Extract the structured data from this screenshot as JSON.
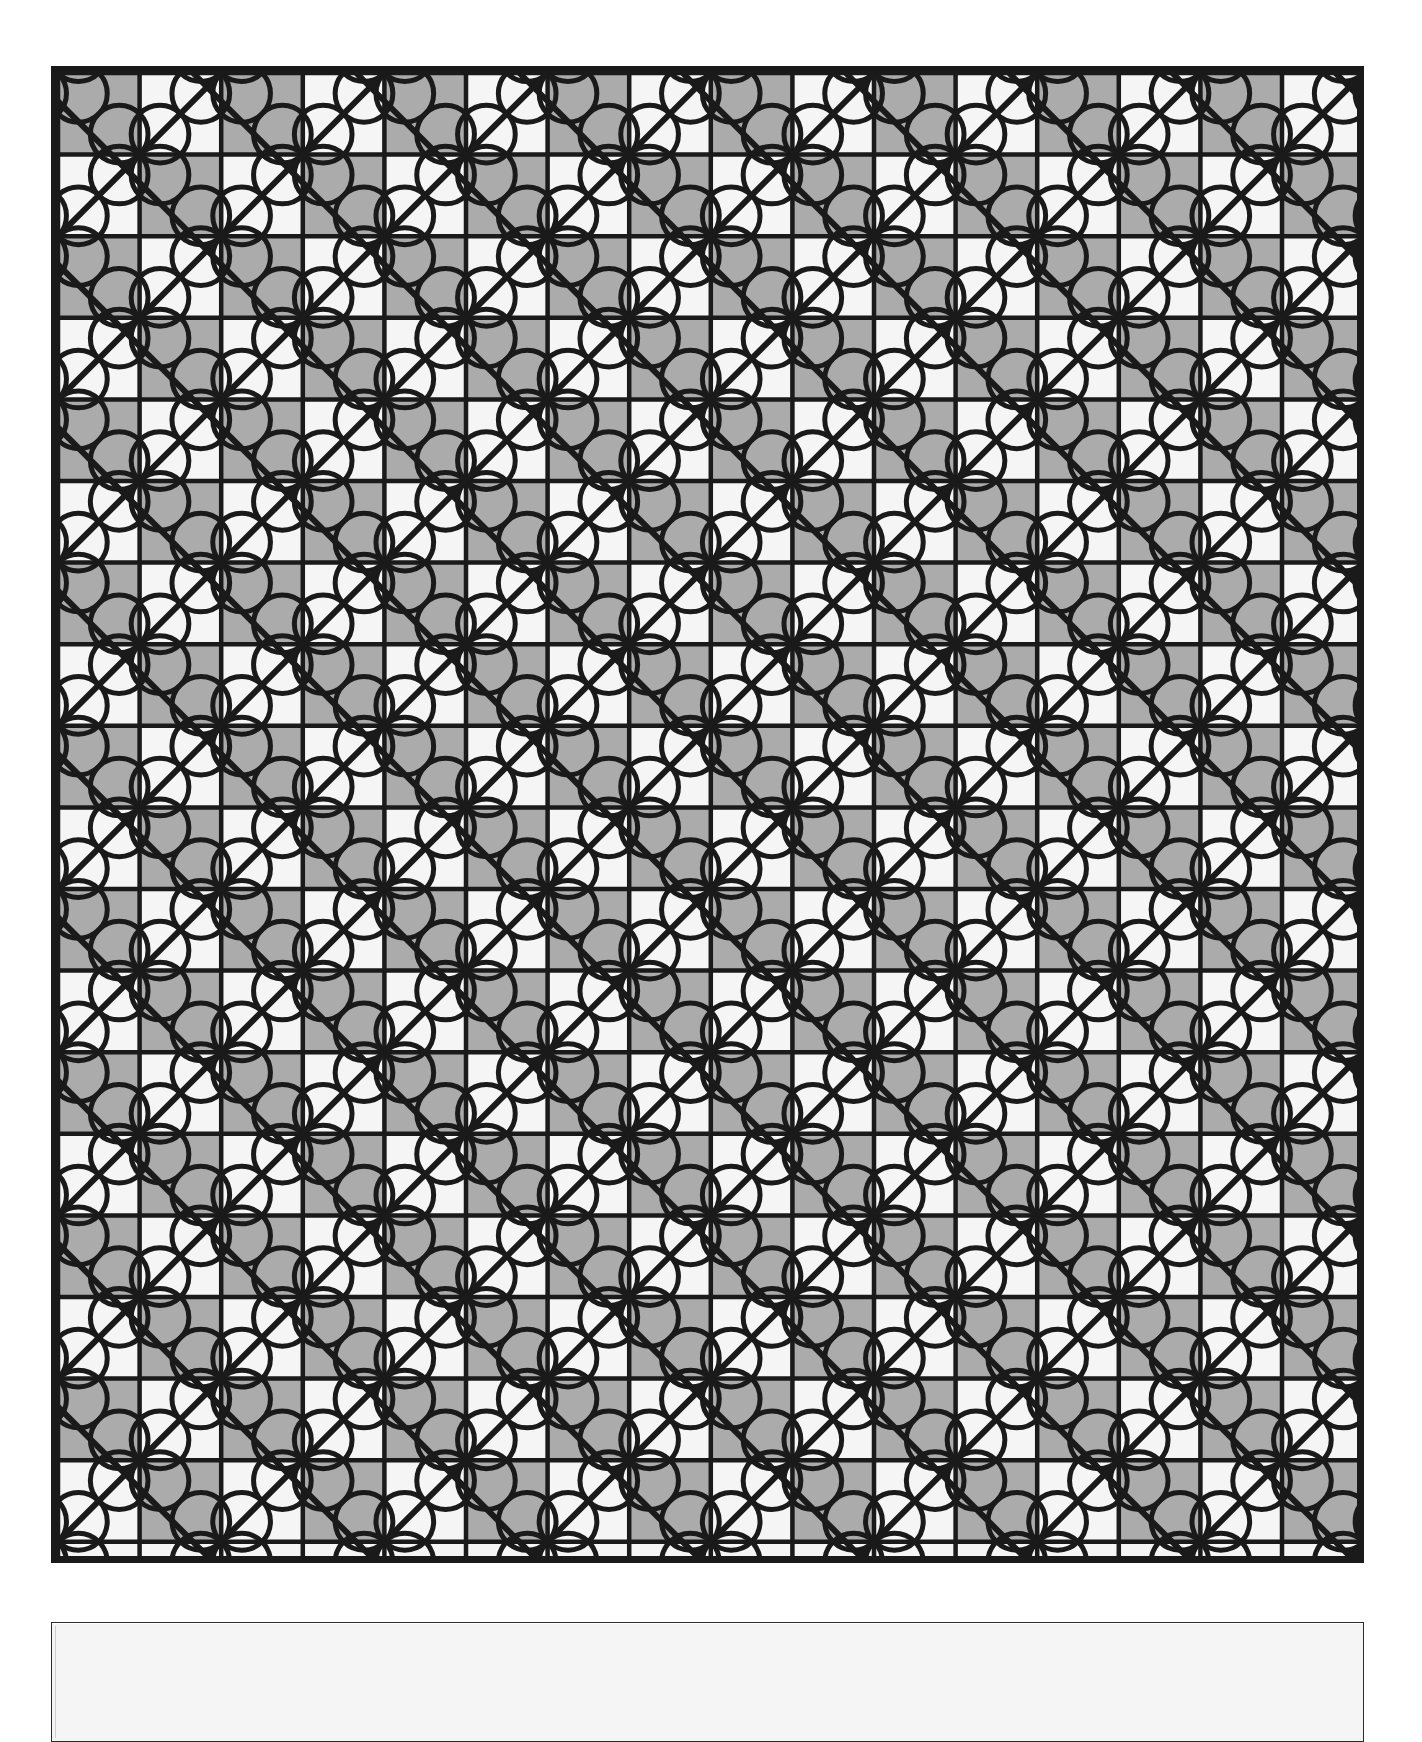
{
  "document": {
    "title": "Quatrefoil Lattice Tiling Pattern",
    "background_color": "#ffffff",
    "width": 1422,
    "height": 1648
  },
  "main_panel": {
    "name": "pattern-figure",
    "description": "Black and white geometric tiling: checkerboard of squares overlaid with outlined quatrefoil flowers at alternating lattice intersections and continuous 45-degree diagonal lines",
    "x": 51,
    "y": 66,
    "width": 1313,
    "height": 1497,
    "border_color": "#1a1a1a",
    "border_width": 7
  },
  "secondary_panel": {
    "name": "empty-caption-panel",
    "x": 51,
    "y": 1622,
    "width": 1313,
    "height": 120,
    "fill_color": "#f5f5f5",
    "border_color": "#2b2b2b",
    "border_width": 1,
    "label": ""
  },
  "pattern": {
    "type": "quatrefoil-lattice",
    "cell_size": 81.6,
    "columns": 16,
    "rows": 18,
    "light_square_color": "#f5f5f5",
    "dark_square_color": "#ababab",
    "line_color": "#1a1a1a",
    "grid_line_width": 4.5,
    "diagonal_line_width": 6,
    "flower_outline_width": 5,
    "flower_petal_radius": 40.8,
    "flower_pitch": 163.2,
    "flower_parity_offset": 0,
    "diagonal_spacing": 163.2,
    "diagonal_angles_deg": [
      45,
      135
    ],
    "checkerboard_start": "dark",
    "clip_to_panel": true
  },
  "legend": {
    "visible": false,
    "entries": []
  },
  "annotations": []
}
